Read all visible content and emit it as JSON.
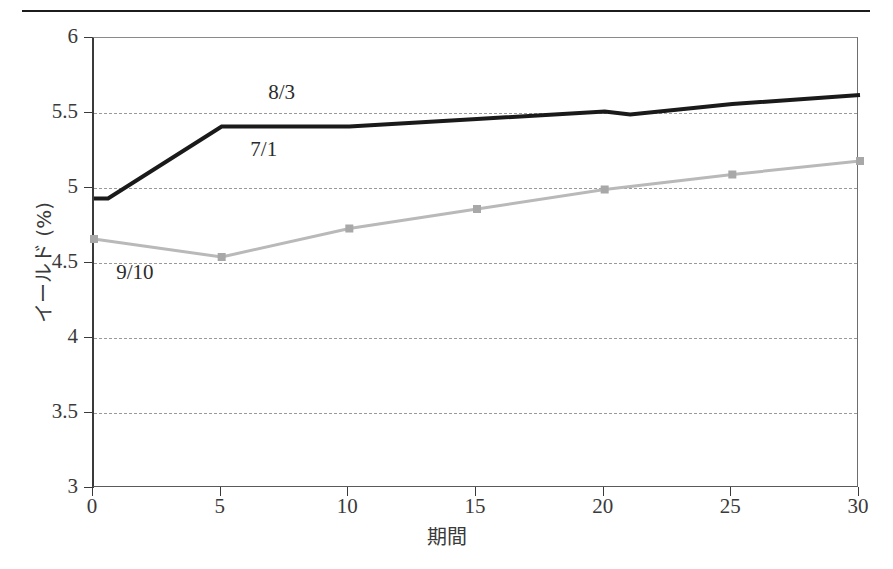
{
  "page": {
    "clipped_header_text": "",
    "rule_color": "#1c1c1c"
  },
  "chart_data": {
    "type": "line",
    "title": "",
    "subtitle": "",
    "xlabel": "期間",
    "ylabel": "イールド (%)",
    "xlim": [
      0,
      30
    ],
    "ylim": [
      3,
      6
    ],
    "xticks": [
      0,
      5,
      10,
      15,
      20,
      25,
      30
    ],
    "xtick_labels": [
      "0",
      "5",
      "10",
      "15",
      "20",
      "25",
      "30"
    ],
    "yticks": [
      3,
      3.5,
      4,
      4.5,
      5,
      5.5,
      6
    ],
    "ytick_labels": [
      "3",
      "3.5",
      "4",
      "4.5",
      "5",
      "5.5",
      "6"
    ],
    "grid": "horizontal-dashed",
    "legend": "none",
    "series": [
      {
        "name": "8/3",
        "color": "#1a1a1a",
        "line_width": 4,
        "markers": false,
        "x": [
          0,
          0.55,
          5,
          10,
          15,
          20,
          21,
          25,
          30
        ],
        "values": [
          4.93,
          4.93,
          5.41,
          5.41,
          5.46,
          5.51,
          5.49,
          5.56,
          5.62
        ]
      },
      {
        "name": "9/10",
        "color": "#b9b9b9",
        "line_width": 3,
        "markers": true,
        "x": [
          0,
          5,
          10,
          15,
          20,
          25,
          30
        ],
        "values": [
          4.66,
          4.54,
          4.73,
          4.86,
          4.99,
          5.09,
          5.18
        ]
      }
    ],
    "annotations": [
      {
        "text": "8/3",
        "x": 6.9,
        "y": 5.63
      },
      {
        "text": "7/1",
        "x": 6.2,
        "y": 5.25
      },
      {
        "text": "9/10",
        "x": 0.95,
        "y": 4.43
      }
    ]
  }
}
